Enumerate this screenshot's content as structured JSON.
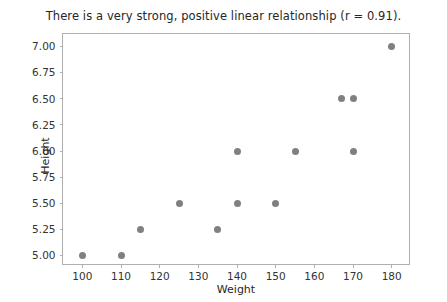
{
  "chart_data": {
    "type": "scatter",
    "title": "There is a very strong, positive linear relationship (r = 0.91).",
    "xlabel": "Weight",
    "ylabel": "Height",
    "xlim": [
      95,
      185
    ],
    "ylim": [
      4.9,
      7.12
    ],
    "xticks": [
      100,
      110,
      120,
      130,
      140,
      150,
      160,
      170,
      180
    ],
    "xtick_labels": [
      "100",
      "110",
      "120",
      "130",
      "140",
      "150",
      "160",
      "170",
      "180"
    ],
    "yticks": [
      5.0,
      5.25,
      5.5,
      5.75,
      6.0,
      6.25,
      6.5,
      6.75,
      7.0
    ],
    "ytick_labels": [
      "5.00",
      "5.25",
      "5.50",
      "5.75",
      "6.00",
      "6.25",
      "6.50",
      "6.75",
      "7.00"
    ],
    "grid": false,
    "legend": false,
    "marker_color": "#808080",
    "correlation": 0.91,
    "points": [
      {
        "x": 100,
        "y": 5.0
      },
      {
        "x": 110,
        "y": 5.0
      },
      {
        "x": 115,
        "y": 5.25
      },
      {
        "x": 125,
        "y": 5.5
      },
      {
        "x": 135,
        "y": 5.25
      },
      {
        "x": 140,
        "y": 5.5
      },
      {
        "x": 140,
        "y": 6.0
      },
      {
        "x": 150,
        "y": 5.5
      },
      {
        "x": 155,
        "y": 6.0
      },
      {
        "x": 167,
        "y": 6.5
      },
      {
        "x": 170,
        "y": 6.5
      },
      {
        "x": 170,
        "y": 6.0
      },
      {
        "x": 180,
        "y": 7.0
      }
    ]
  }
}
